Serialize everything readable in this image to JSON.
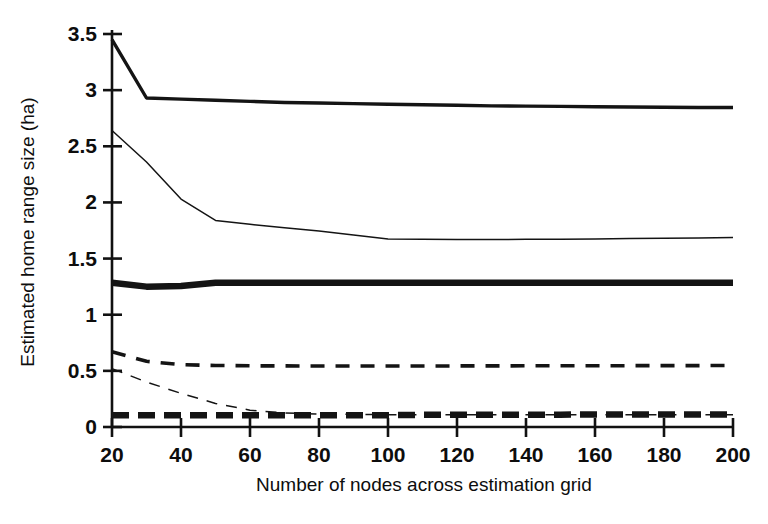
{
  "figure": {
    "background_color": "#ffffff",
    "ink_color": "#141414"
  },
  "chart_data": {
    "type": "line",
    "title": "",
    "xlabel": "Number of nodes across estimation grid",
    "ylabel": "Estimated home range size (ha)",
    "xlim": [
      20,
      200
    ],
    "ylim": [
      0,
      3.5
    ],
    "grid": false,
    "legend": "none",
    "xticks": [
      20,
      40,
      60,
      80,
      100,
      120,
      140,
      160,
      180,
      200
    ],
    "xtick_labels": [
      "20",
      "40",
      "60",
      "80",
      "100",
      "120",
      "140",
      "160",
      "180",
      "200"
    ],
    "yticks": [
      0,
      0.5,
      1,
      1.5,
      2,
      2.5,
      3,
      3.5
    ],
    "ytick_labels": [
      "0",
      "0.5",
      "1",
      "1.5",
      "2",
      "2.5",
      "3",
      "3.5"
    ],
    "x": [
      20,
      30,
      40,
      50,
      60,
      70,
      80,
      90,
      100,
      110,
      120,
      130,
      140,
      150,
      160,
      170,
      180,
      190,
      200
    ],
    "series": [
      {
        "name": "series-1-thick-solid",
        "style": "solid",
        "stroke_width": 3.4,
        "values": [
          3.45,
          2.93,
          2.92,
          2.91,
          2.9,
          2.89,
          2.885,
          2.88,
          2.875,
          2.87,
          2.865,
          2.86,
          2.858,
          2.855,
          2.852,
          2.85,
          2.848,
          2.846,
          2.845
        ]
      },
      {
        "name": "series-2-thin-solid",
        "style": "solid",
        "stroke_width": 1.5,
        "values": [
          2.64,
          2.36,
          2.03,
          1.84,
          1.805,
          1.775,
          1.745,
          1.71,
          1.675,
          1.672,
          1.67,
          1.67,
          1.671,
          1.673,
          1.675,
          1.678,
          1.681,
          1.684,
          1.687
        ]
      },
      {
        "name": "series-3-very-thick-solid",
        "style": "solid",
        "stroke_width": 6.5,
        "values": [
          1.285,
          1.25,
          1.255,
          1.285,
          1.285,
          1.285,
          1.285,
          1.285,
          1.285,
          1.285,
          1.285,
          1.285,
          1.285,
          1.285,
          1.285,
          1.285,
          1.285,
          1.285,
          1.285
        ]
      },
      {
        "name": "series-4-thick-dashed",
        "style": "dashed",
        "stroke_width": 3.6,
        "dash": "14,11",
        "values": [
          0.67,
          0.585,
          0.555,
          0.548,
          0.545,
          0.544,
          0.543,
          0.543,
          0.543,
          0.543,
          0.544,
          0.544,
          0.545,
          0.545,
          0.546,
          0.546,
          0.547,
          0.547,
          0.548
        ]
      },
      {
        "name": "series-5-thin-dashed",
        "style": "dashed",
        "stroke_width": 1.5,
        "dash": "11,9",
        "values": [
          0.52,
          0.4,
          0.3,
          0.21,
          0.15,
          0.125,
          0.115,
          0.112,
          0.11,
          0.11,
          0.11,
          0.11,
          0.11,
          0.11,
          0.11,
          0.11,
          0.11,
          0.11,
          0.11
        ]
      },
      {
        "name": "series-6-very-thick-dashed",
        "style": "dashed",
        "stroke_width": 6.5,
        "dash": "17,9",
        "values": [
          0.105,
          0.105,
          0.105,
          0.105,
          0.105,
          0.105,
          0.105,
          0.105,
          0.105,
          0.108,
          0.108,
          0.11,
          0.11,
          0.11,
          0.112,
          0.112,
          0.112,
          0.112,
          0.112
        ]
      }
    ]
  }
}
